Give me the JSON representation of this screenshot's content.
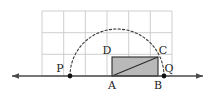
{
  "figure": {
    "background_color": "#ffffff",
    "grid": {
      "visible": true,
      "color": "#c9c9c9",
      "columns": 6,
      "rows": 3,
      "cell_size_px": 21.7,
      "left_px": 42,
      "top_px": 11,
      "right_px": 172,
      "bottom_px": 76
    },
    "axis_line": {
      "visible": true,
      "color": "#4a4a4a",
      "y_px": 76,
      "x_start_px": 12,
      "x_end_px": 203,
      "arrow_left": true,
      "arrow_right": true
    },
    "arc": {
      "type": "semicircle",
      "style": "dashed",
      "color": "#3a3a3a",
      "center_x_px": 117,
      "center_y_px": 76,
      "radius_px": 47
    },
    "rectangle": {
      "fill_color": "#b9b9b9",
      "stroke_color": "#2b2b2b",
      "left_px": 112,
      "right_px": 158,
      "top_px": 57,
      "bottom_px": 76
    },
    "diagonal": {
      "from": "A",
      "to": "C",
      "color": "#2b2b2b"
    },
    "points": [
      {
        "id": "P",
        "label": "P",
        "x_px": 70,
        "y_px": 76,
        "dot": true,
        "label_dx": -10,
        "label_dy": -7
      },
      {
        "id": "Q",
        "label": "Q",
        "x_px": 164,
        "y_px": 76,
        "dot": true,
        "label_dx": 5,
        "label_dy": -7
      },
      {
        "id": "A",
        "label": "A",
        "x_px": 112,
        "y_px": 76,
        "dot": false,
        "label_dx": 0,
        "label_dy": 10
      },
      {
        "id": "B",
        "label": "B",
        "x_px": 158,
        "y_px": 76,
        "dot": false,
        "label_dx": 0,
        "label_dy": 10
      },
      {
        "id": "C",
        "label": "C",
        "x_px": 158,
        "y_px": 57,
        "dot": false,
        "label_dx": 5,
        "label_dy": -6
      },
      {
        "id": "D",
        "label": "D",
        "x_px": 112,
        "y_px": 57,
        "dot": false,
        "label_dx": -5,
        "label_dy": -6
      }
    ],
    "labels": {
      "P": "P",
      "Q": "Q",
      "A": "A",
      "B": "B",
      "C": "C",
      "D": "D"
    }
  }
}
